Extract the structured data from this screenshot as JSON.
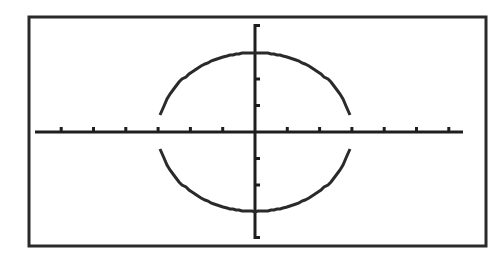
{
  "window": {
    "frame": {
      "x": 29,
      "y": 17,
      "width": 457,
      "height": 229,
      "stroke": "#2a2a2a"
    }
  },
  "chart_data": {
    "type": "line",
    "title": "",
    "xlabel": "",
    "ylabel": "",
    "xlim": [
      -6,
      6.3
    ],
    "ylim": [
      -4.1,
      4.1
    ],
    "x_ticks": [
      -6,
      -5,
      -4,
      -3,
      -2,
      -1,
      1,
      2,
      3,
      4,
      5,
      6
    ],
    "y_ticks": [
      -2,
      -1,
      1,
      2
    ],
    "grid": false,
    "series": [
      {
        "name": "upper semicircle",
        "equation": "y = sqrt(9 - x^2)",
        "x": [
          -3,
          -2.5,
          -2,
          -1.5,
          -1,
          -0.5,
          0,
          0.5,
          1,
          1.5,
          2,
          2.5,
          3
        ],
        "y": [
          0.3,
          1.66,
          2.24,
          2.6,
          2.83,
          2.96,
          3,
          2.96,
          2.83,
          2.6,
          2.24,
          1.66,
          0.3
        ]
      },
      {
        "name": "lower semicircle",
        "equation": "y = -sqrt(9 - x^2)",
        "x": [
          -3,
          -2.5,
          -2,
          -1.5,
          -1,
          -0.5,
          0,
          0.5,
          1,
          1.5,
          2,
          2.5,
          3
        ],
        "y": [
          -0.3,
          -1.66,
          -2.24,
          -2.6,
          -2.83,
          -2.96,
          -3,
          -2.96,
          -2.83,
          -2.6,
          -2.24,
          -1.66,
          -0.3
        ]
      }
    ],
    "colors": {
      "axis": "#1e1e1e",
      "curve": "#2a2a2a",
      "background": "#ffffff"
    }
  },
  "layout": {
    "origin_px": [
      255,
      132
    ],
    "x_unit_px": 32.3,
    "y_unit_px": 26.5,
    "x_axis_px": [
      35,
      463
    ],
    "y_axis_px": [
      24,
      239
    ]
  }
}
